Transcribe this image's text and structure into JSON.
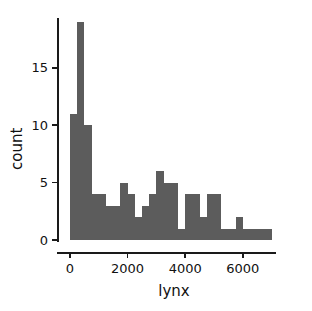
{
  "chart_data": {
    "type": "bar",
    "title": "",
    "subtitle": "",
    "xlabel": "lynx",
    "ylabel": "count",
    "xlim": [
      -200,
      7150
    ],
    "ylim": [
      0,
      19.8
    ],
    "xticks": [
      0,
      2000,
      4000,
      6000
    ],
    "xticklabels": [
      "0",
      "2000",
      "4000",
      "6000"
    ],
    "yticks": [
      0,
      5,
      10,
      15
    ],
    "yticklabels": [
      "0",
      "5",
      "10",
      "15"
    ],
    "grid": false,
    "legend": null,
    "bin_width": 250,
    "bar_color": "#5c5c5c",
    "categories": [
      "0-250",
      "250-500",
      "500-750",
      "750-1000",
      "1000-1250",
      "1250-1500",
      "1500-1750",
      "1750-2000",
      "2000-2250",
      "2250-2500",
      "2500-2750",
      "2750-3000",
      "3000-3250",
      "3250-3500",
      "3500-3750",
      "3750-4000",
      "4000-4250",
      "4250-4500",
      "4500-4750",
      "4750-5000",
      "5000-5250",
      "5250-5500",
      "5500-5750",
      "5750-6000",
      "6000-6250",
      "6250-6500",
      "6500-6750",
      "6750-7000"
    ],
    "bins": [
      0,
      250,
      500,
      750,
      1000,
      1250,
      1500,
      1750,
      2000,
      2250,
      2500,
      2750,
      3000,
      3250,
      3500,
      3750,
      4000,
      4250,
      4500,
      4750,
      5000,
      5250,
      5500,
      5750,
      6000,
      6250,
      6500,
      6750,
      7000
    ],
    "values": [
      11,
      19,
      10,
      4,
      4,
      3,
      3,
      5,
      4,
      2,
      3,
      4,
      6,
      5,
      5,
      1,
      4,
      4,
      2,
      4,
      4,
      1,
      1,
      2,
      0,
      1,
      0,
      1
    ],
    "series": [
      {
        "name": "count",
        "values": [
          11,
          19,
          10,
          4,
          4,
          3,
          3,
          5,
          4,
          2,
          3,
          4,
          6,
          5,
          5,
          1,
          4,
          4,
          2,
          4,
          4,
          1,
          1,
          2,
          0,
          1,
          0,
          1
        ]
      }
    ],
    "extra_bars": [
      {
        "x0": 4900,
        "x1": 5150,
        "value": 1
      },
      {
        "x0": 5850,
        "x1": 6250,
        "value": 1
      },
      {
        "x0": 6500,
        "x1": 6900,
        "value": 1
      }
    ]
  }
}
